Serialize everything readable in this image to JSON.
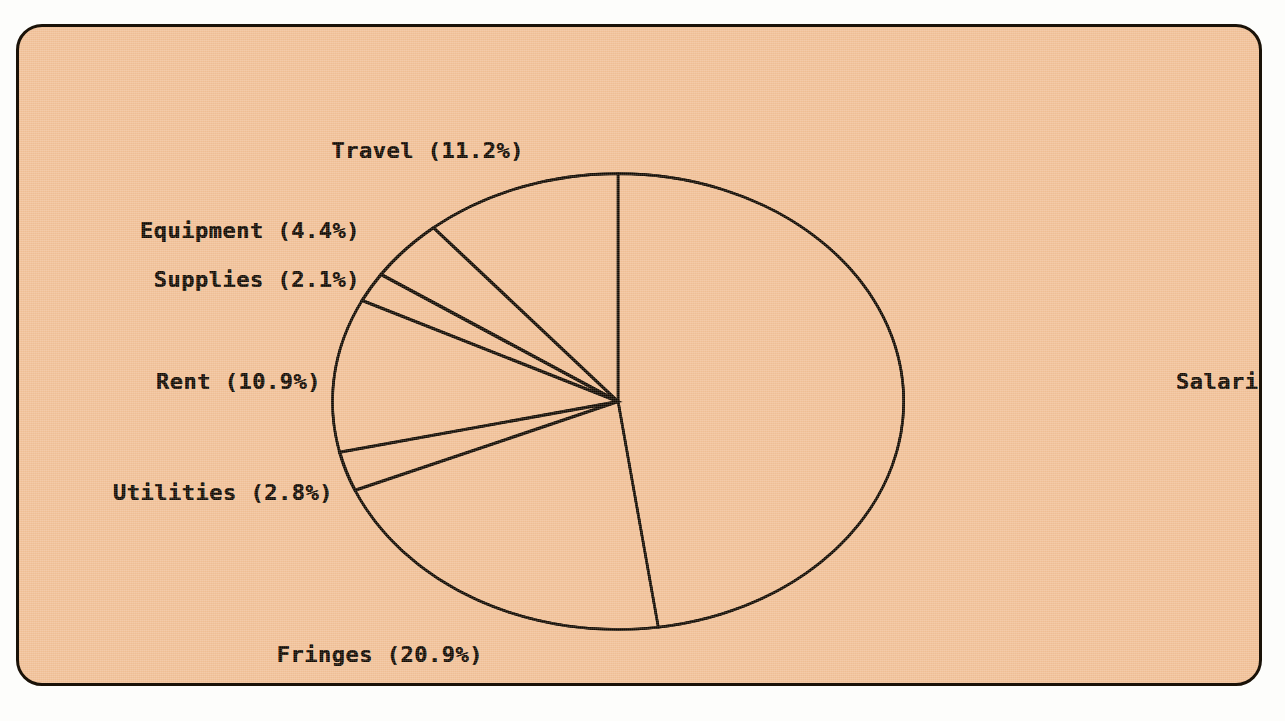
{
  "figure": {
    "background_color": "#f2c49c",
    "border_color": "#1a1208",
    "text_color": "#100b04",
    "outside_color": "#fdfdfb"
  },
  "chart_data": {
    "type": "pie",
    "title": "",
    "xlabel": "",
    "ylabel": "",
    "start_angle": 90,
    "direction": "clockwise",
    "legend": "none",
    "labels_inline": true,
    "grid": false,
    "categories": [
      "Salaries",
      "Fringes",
      "Utilities",
      "Rent",
      "Supplies",
      "Equipment",
      "Travel"
    ],
    "values": [
      47.8,
      20.9,
      2.8,
      10.9,
      2.1,
      4.4,
      11.2
    ],
    "unit": "%",
    "slices": [
      {
        "name": "Salaries",
        "value": 47.8,
        "label": "Salaries (47.8%)",
        "label_x": 1173,
        "label_y": 379,
        "align": "left"
      },
      {
        "name": "Fringes",
        "value": 20.9,
        "label": "Fringes (20.9%)",
        "label_x": 480,
        "label_y": 652,
        "align": "right"
      },
      {
        "name": "Utilities",
        "value": 2.8,
        "label": "Utilities (2.8%)",
        "label_x": 330,
        "label_y": 490,
        "align": "right"
      },
      {
        "name": "Rent",
        "value": 10.9,
        "label": "Rent (10.9%)",
        "label_x": 318,
        "label_y": 379,
        "align": "right"
      },
      {
        "name": "Supplies",
        "value": 2.1,
        "label": "Supplies (2.1%)",
        "label_x": 357,
        "label_y": 277,
        "align": "right"
      },
      {
        "name": "Equipment",
        "value": 4.4,
        "label": "Equipment (4.4%)",
        "label_x": 357,
        "label_y": 228,
        "align": "right"
      },
      {
        "name": "Travel",
        "value": 11.2,
        "label": "Travel (11.2%)",
        "label_x": 521,
        "label_y": 148,
        "align": "right"
      }
    ]
  }
}
